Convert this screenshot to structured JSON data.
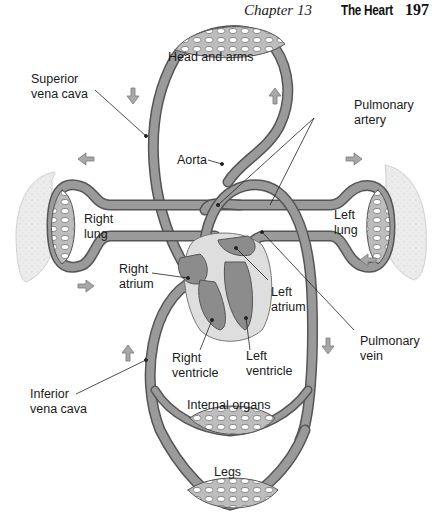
{
  "header": {
    "chapter": "Chapter 13",
    "title": "The Heart",
    "page_number": "197"
  },
  "diagram": {
    "labels": {
      "head_and_arms": "Head and arms",
      "superior_vena_cava": "Superior\nvena cava",
      "pulmonary_artery": "Pulmonary\nartery",
      "aorta": "Aorta",
      "right_lung": "Right\nlung",
      "left_lung": "Left\nlung",
      "right_atrium": "Right\natrium",
      "left_atrium": "Left\natrium",
      "pulmonary_vein": "Pulmonary\nvein",
      "right_ventricle": "Right\nventricle",
      "left_ventricle": "Left\nventricle",
      "inferior_vena_cava": "Inferior\nvena cava",
      "internal_organs": "Internal organs",
      "legs": "Legs"
    },
    "colors": {
      "vessel_fill": "#9a9a9a",
      "vessel_outline": "#555555",
      "capillary_bed": "#bdbdbd",
      "lung_fill": "#e8e8e8",
      "heart_pericardium": "#dedede",
      "heart_chamber": "#8c8c8c",
      "arrow_fill": "#a8a8a8",
      "text": "#1a1a1a"
    },
    "flow_arrows": [
      "down-left-top",
      "up-right-top",
      "left-upper",
      "right-upper-right",
      "right-lower-left",
      "left-lower-right",
      "up-left-lower",
      "down-right-lower"
    ]
  }
}
